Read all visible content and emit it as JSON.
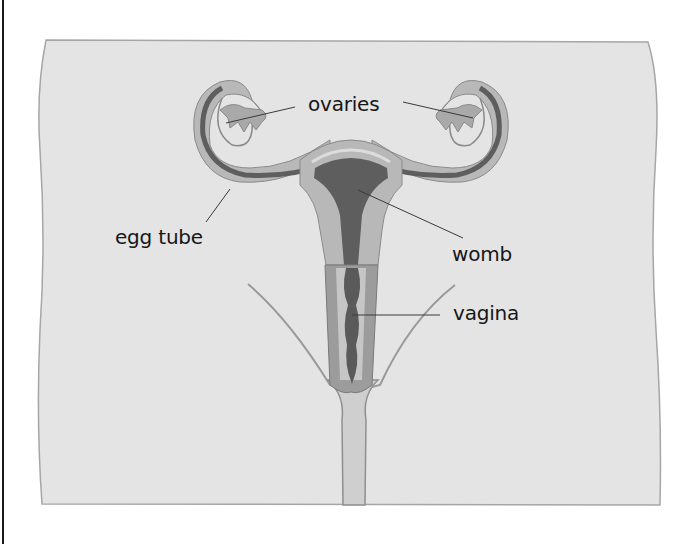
{
  "diagram": {
    "labels": {
      "ovaries": "ovaries",
      "egg_tube": "egg tube",
      "womb": "womb",
      "vagina": "vagina"
    },
    "colors": {
      "background": "#ffffff",
      "body_fill": "#e4e4e4",
      "body_edge": "#9a9a9a",
      "organ_light": "#b8b8b8",
      "organ_dark": "#5e5e5e",
      "organ_lining": "#d8d8d8",
      "leader_line": "#3a3a3a",
      "text": "#161616"
    }
  }
}
